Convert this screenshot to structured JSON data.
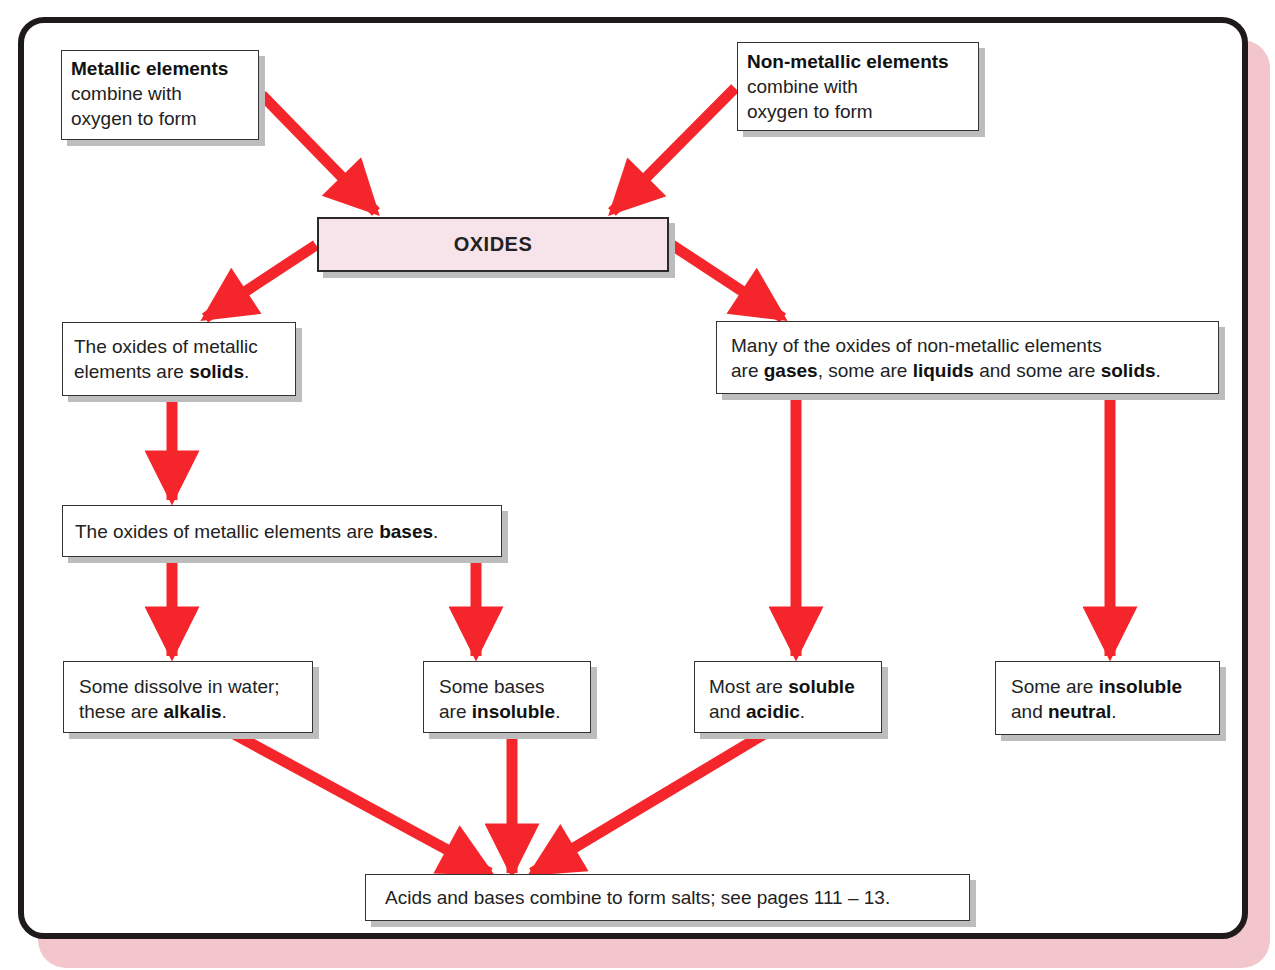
{
  "diagram": {
    "title": "OXIDES",
    "colors": {
      "arrow": "#f5262b",
      "frame": "#1e1a1c",
      "frame_shadow": "#f3c6cc",
      "oxides_fill": "#f7e4ea",
      "box_shadow": "#bdbdbd"
    },
    "nodes": {
      "metallic": {
        "bold": "Metallic elements",
        "line2": "combine with",
        "line3": "oxygen to form"
      },
      "nonmetallic": {
        "bold": "Non-metallic elements",
        "line2": "combine with",
        "line3": "oxygen to form"
      },
      "oxides": {
        "label": "OXIDES"
      },
      "metal_solids": {
        "line1": "The oxides of metallic",
        "pre": "elements are ",
        "bold": "solids",
        "post": "."
      },
      "metal_bases": {
        "pre": "The oxides of metallic elements are ",
        "bold": "bases",
        "post": "."
      },
      "nonmetal_states": {
        "line1": "Many of the oxides of non-metallic elements",
        "pre": "are ",
        "bold1": "gases",
        "mid1": ", some are ",
        "bold2": "liquids",
        "mid2": " and some are ",
        "bold3": "solids",
        "post": "."
      },
      "alkalis": {
        "line1": "Some dissolve in water;",
        "pre": "these are ",
        "bold": "alkalis",
        "post": "."
      },
      "insoluble_bases": {
        "line1": "Some bases",
        "pre": "are ",
        "bold": "insoluble",
        "post": "."
      },
      "soluble_acidic": {
        "pre1": "Most are ",
        "bold1": "soluble",
        "pre2": "and ",
        "bold2": "acidic",
        "post": "."
      },
      "insoluble_neutral": {
        "pre1": "Some are ",
        "bold1": "insoluble",
        "pre2": "and ",
        "bold2": "neutral",
        "post": "."
      },
      "salts": {
        "label": "Acids and bases combine to form salts; see pages 111 – 13."
      }
    },
    "edges": [
      {
        "from": "metallic",
        "to": "oxides"
      },
      {
        "from": "nonmetallic",
        "to": "oxides"
      },
      {
        "from": "oxides",
        "to": "metal_solids"
      },
      {
        "from": "oxides",
        "to": "nonmetal_states"
      },
      {
        "from": "metal_solids",
        "to": "metal_bases"
      },
      {
        "from": "metal_bases",
        "to": "alkalis"
      },
      {
        "from": "metal_bases",
        "to": "insoluble_bases"
      },
      {
        "from": "nonmetal_states",
        "to": "soluble_acidic"
      },
      {
        "from": "nonmetal_states",
        "to": "insoluble_neutral"
      },
      {
        "from": "alkalis",
        "to": "salts"
      },
      {
        "from": "insoluble_bases",
        "to": "salts"
      },
      {
        "from": "soluble_acidic",
        "to": "salts"
      }
    ]
  }
}
